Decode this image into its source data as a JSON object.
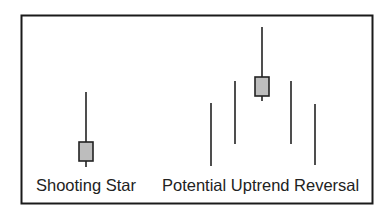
{
  "diagram": {
    "type": "candlestick-pattern-illustration",
    "colors": {
      "frame": "#1a1a1a",
      "wick": "#222222",
      "body_fill": "#bdbdbd",
      "body_stroke": "#222222",
      "background": "#ffffff"
    },
    "labels": {
      "shooting_star": "Shooting Star",
      "uptrend_reversal": "Potential Uptrend Reversal"
    },
    "shooting_star_candle": {
      "x": 86,
      "high": 92,
      "body_top": 142,
      "body_bottom": 161,
      "low": 167
    },
    "reversal_pattern": [
      {
        "kind": "line",
        "x": 211,
        "high": 103,
        "low": 166
      },
      {
        "kind": "line",
        "x": 235,
        "high": 81,
        "low": 144
      },
      {
        "kind": "candle",
        "x": 262,
        "high": 27,
        "body_top": 77,
        "body_bottom": 96,
        "low": 101
      },
      {
        "kind": "line",
        "x": 291,
        "high": 81,
        "low": 144
      },
      {
        "kind": "line",
        "x": 315,
        "high": 104,
        "low": 165
      }
    ]
  }
}
